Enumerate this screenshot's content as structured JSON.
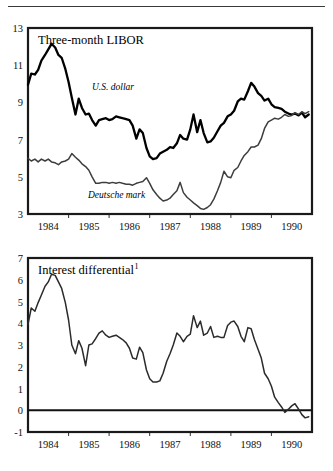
{
  "figure": {
    "background": "#ffffff",
    "rule_color": "#3a3a3a"
  },
  "chart_data": [
    {
      "type": "line",
      "id": "three-month-libor",
      "title": "Three-month LIBOR",
      "xlabel": "",
      "ylabel": "",
      "xlim": [
        1983.5,
        1990.5
      ],
      "ylim": [
        3,
        13
      ],
      "yticks": [
        3,
        5,
        7,
        9,
        11,
        13
      ],
      "ytick_labels": [
        "3",
        "5",
        "7",
        "9",
        "11",
        "13"
      ],
      "xticks": [
        1984,
        1985,
        1986,
        1987,
        1988,
        1989,
        1990
      ],
      "xtick_labels": [
        "1984",
        "1985",
        "1986",
        "1987",
        "1988",
        "1989",
        "1990"
      ],
      "grid": "horizontal-and-vertical",
      "legend_position": "inline-annotation",
      "series": [
        {
          "name": "U.S. dollar",
          "label_text": "U.S. dollar",
          "label_style": "italic",
          "color": "#000000",
          "line_width": "thick",
          "x": [
            1983.5,
            1983.58,
            1983.67,
            1983.75,
            1983.83,
            1983.92,
            1984.0,
            1984.08,
            1984.17,
            1984.25,
            1984.33,
            1984.42,
            1984.5,
            1984.58,
            1984.67,
            1984.75,
            1984.83,
            1984.92,
            1985.0,
            1985.08,
            1985.17,
            1985.25,
            1985.33,
            1985.42,
            1985.5,
            1985.58,
            1985.67,
            1985.75,
            1985.83,
            1985.92,
            1986.0,
            1986.08,
            1986.17,
            1986.25,
            1986.33,
            1986.42,
            1986.5,
            1986.58,
            1986.67,
            1986.75,
            1986.83,
            1986.92,
            1987.0,
            1987.08,
            1987.17,
            1987.25,
            1987.33,
            1987.42,
            1987.5,
            1987.58,
            1987.67,
            1987.75,
            1987.83,
            1987.92,
            1988.0,
            1988.08,
            1988.17,
            1988.25,
            1988.33,
            1988.42,
            1988.5,
            1988.58,
            1988.67,
            1988.75,
            1988.83,
            1988.92,
            1989.0,
            1989.08,
            1989.17,
            1989.25,
            1989.33,
            1989.42,
            1989.5,
            1989.58,
            1989.67,
            1989.75,
            1989.83,
            1989.92,
            1990.0,
            1990.08,
            1990.17,
            1990.25,
            1990.33,
            1990.42
          ],
          "y": [
            9.95,
            10.55,
            10.5,
            10.75,
            11.25,
            11.55,
            11.85,
            12.15,
            11.95,
            11.55,
            11.4,
            10.8,
            10.1,
            9.25,
            8.35,
            9.2,
            8.7,
            8.35,
            8.4,
            8.05,
            7.75,
            8.05,
            8.1,
            8.15,
            8.05,
            8.1,
            8.25,
            8.2,
            8.15,
            8.1,
            8.05,
            7.75,
            7.05,
            7.55,
            7.35,
            6.55,
            6.1,
            5.95,
            6.0,
            6.25,
            6.35,
            6.45,
            6.6,
            6.55,
            6.8,
            7.25,
            7.05,
            7.0,
            7.55,
            8.35,
            7.4,
            8.05,
            7.35,
            6.85,
            6.9,
            7.1,
            7.45,
            7.75,
            7.9,
            8.25,
            8.35,
            8.55,
            9.05,
            9.2,
            9.15,
            9.6,
            10.05,
            9.85,
            9.5,
            9.35,
            9.1,
            9.2,
            8.9,
            8.75,
            8.7,
            8.65,
            8.5,
            8.4,
            8.35,
            8.4,
            8.3,
            8.45,
            8.2,
            8.35
          ]
        },
        {
          "name": "Deutsche mark",
          "label_text": "Deutsche mark",
          "label_style": "italic",
          "color": "#3d3d3d",
          "line_width": "thin",
          "x": [
            1983.5,
            1983.58,
            1983.67,
            1983.75,
            1983.83,
            1983.92,
            1984.0,
            1984.08,
            1984.17,
            1984.25,
            1984.33,
            1984.42,
            1984.5,
            1984.58,
            1984.67,
            1984.75,
            1984.83,
            1984.92,
            1985.0,
            1985.08,
            1985.17,
            1985.25,
            1985.33,
            1985.42,
            1985.5,
            1985.58,
            1985.67,
            1985.75,
            1985.83,
            1985.92,
            1986.0,
            1986.08,
            1986.17,
            1986.25,
            1986.33,
            1986.42,
            1986.5,
            1986.58,
            1986.67,
            1986.75,
            1986.83,
            1986.92,
            1987.0,
            1987.08,
            1987.17,
            1987.25,
            1987.33,
            1987.42,
            1987.5,
            1987.58,
            1987.67,
            1987.75,
            1987.83,
            1987.92,
            1988.0,
            1988.08,
            1988.17,
            1988.25,
            1988.33,
            1988.42,
            1988.5,
            1988.58,
            1988.67,
            1988.75,
            1988.83,
            1988.92,
            1989.0,
            1989.08,
            1989.17,
            1989.25,
            1989.33,
            1989.42,
            1989.5,
            1989.58,
            1989.67,
            1989.75,
            1989.83,
            1989.92,
            1990.0,
            1990.08,
            1990.17,
            1990.25,
            1990.33,
            1990.42
          ],
          "y": [
            6.0,
            5.85,
            5.95,
            5.8,
            5.95,
            5.85,
            5.95,
            5.8,
            5.75,
            5.65,
            5.8,
            5.85,
            5.95,
            6.25,
            6.05,
            5.9,
            5.7,
            5.55,
            5.35,
            5.0,
            4.65,
            4.65,
            4.7,
            4.7,
            4.65,
            4.7,
            4.65,
            4.7,
            4.65,
            4.6,
            4.6,
            4.55,
            4.65,
            4.7,
            4.75,
            4.95,
            4.65,
            4.3,
            4.05,
            3.85,
            3.7,
            3.75,
            3.85,
            4.05,
            4.25,
            4.7,
            4.15,
            3.9,
            3.75,
            3.6,
            3.45,
            3.3,
            3.25,
            3.35,
            3.5,
            3.8,
            4.25,
            4.7,
            5.3,
            5.0,
            4.95,
            5.35,
            5.5,
            5.85,
            6.15,
            6.35,
            6.6,
            6.6,
            6.7,
            7.05,
            7.6,
            7.95,
            8.05,
            8.15,
            8.1,
            8.2,
            8.35,
            8.25,
            8.3,
            8.45,
            8.35,
            8.5,
            8.4,
            8.5
          ]
        }
      ]
    },
    {
      "type": "line",
      "id": "interest-differential",
      "title": "Interest differential",
      "title_superscript": "1",
      "xlabel": "",
      "ylabel": "",
      "xlim": [
        1983.5,
        1990.5
      ],
      "ylim": [
        -1,
        7
      ],
      "yticks": [
        -1,
        0,
        1,
        2,
        3,
        4,
        5,
        6,
        7
      ],
      "ytick_labels": [
        "-1",
        "0",
        "1",
        "2",
        "3",
        "4",
        "5",
        "6",
        "7"
      ],
      "xticks": [
        1984,
        1985,
        1986,
        1987,
        1988,
        1989,
        1990
      ],
      "xtick_labels": [
        "1984",
        "1985",
        "1986",
        "1987",
        "1988",
        "1989",
        "1990"
      ],
      "grid": "horizontal-and-vertical",
      "zero_line": 0,
      "legend_position": "none",
      "series": [
        {
          "name": "Interest differential",
          "color": "#2b2b2b",
          "line_width": "thin",
          "x": [
            1983.5,
            1983.58,
            1983.67,
            1983.75,
            1983.83,
            1983.92,
            1984.0,
            1984.08,
            1984.17,
            1984.25,
            1984.33,
            1984.42,
            1984.5,
            1984.58,
            1984.67,
            1984.75,
            1984.83,
            1984.92,
            1985.0,
            1985.08,
            1985.17,
            1985.25,
            1985.33,
            1985.42,
            1985.5,
            1985.58,
            1985.67,
            1985.75,
            1985.83,
            1985.92,
            1986.0,
            1986.08,
            1986.17,
            1986.25,
            1986.33,
            1986.42,
            1986.5,
            1986.58,
            1986.67,
            1986.75,
            1986.83,
            1986.92,
            1987.0,
            1987.08,
            1987.17,
            1987.25,
            1987.33,
            1987.42,
            1987.5,
            1987.58,
            1987.67,
            1987.75,
            1987.83,
            1987.92,
            1988.0,
            1988.08,
            1988.17,
            1988.25,
            1988.33,
            1988.42,
            1988.5,
            1988.58,
            1988.67,
            1988.75,
            1988.83,
            1988.92,
            1989.0,
            1989.08,
            1989.17,
            1989.25,
            1989.33,
            1989.42,
            1989.5,
            1989.58,
            1989.67,
            1989.75,
            1989.83,
            1989.92,
            1990.0,
            1990.08,
            1990.17,
            1990.25,
            1990.33,
            1990.42
          ],
          "y": [
            3.95,
            4.7,
            4.55,
            4.95,
            5.3,
            5.7,
            5.9,
            6.25,
            6.2,
            5.9,
            5.6,
            4.95,
            4.15,
            3.0,
            2.6,
            3.2,
            2.85,
            2.05,
            3.0,
            3.05,
            3.3,
            3.55,
            3.65,
            3.45,
            3.35,
            3.4,
            3.45,
            3.35,
            3.25,
            3.1,
            2.85,
            2.4,
            2.35,
            2.9,
            2.65,
            1.85,
            1.45,
            1.3,
            1.3,
            1.35,
            1.7,
            2.25,
            2.6,
            3.0,
            3.55,
            3.4,
            3.15,
            3.4,
            3.5,
            4.35,
            3.8,
            4.1,
            3.45,
            3.55,
            3.85,
            3.35,
            3.4,
            3.35,
            3.35,
            3.9,
            4.05,
            4.1,
            3.85,
            3.4,
            3.15,
            3.8,
            3.75,
            3.25,
            2.8,
            2.4,
            1.7,
            1.45,
            1.1,
            0.6,
            0.35,
            0.15,
            -0.1,
            0.05,
            0.2,
            0.3,
            0.05,
            -0.2,
            -0.35,
            -0.3
          ]
        }
      ]
    }
  ]
}
